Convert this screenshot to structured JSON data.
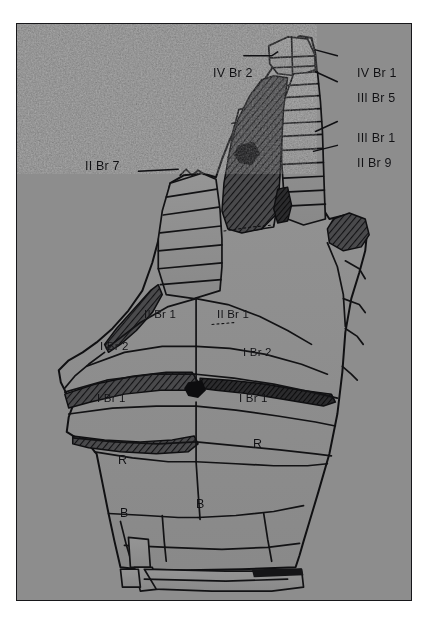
{
  "figure": {
    "kind": "crinoid-calyx-plate-diagram",
    "caption_visible": false,
    "frame": {
      "border_color": "#17171a",
      "field_color": "#8d8d8d",
      "page_color": "#ffffff"
    },
    "ink_color": "#101013"
  },
  "labels": {
    "leader_labels": [
      {
        "id": "iv-br-2",
        "text": "IV Br 2",
        "x": 196,
        "y": 49,
        "anchor": "right",
        "leader": true
      },
      {
        "id": "iv-br-1",
        "text": "IV Br 1",
        "x": 340,
        "y": 49,
        "anchor": "left",
        "leader": true
      },
      {
        "id": "iii-br-5",
        "text": "III Br 5",
        "x": 340,
        "y": 74,
        "anchor": "left",
        "leader": true
      },
      {
        "id": "iii-br-1",
        "text": "III Br 1",
        "x": 340,
        "y": 114,
        "anchor": "left",
        "leader": true
      },
      {
        "id": "ii-br-9",
        "text": "II Br 9",
        "x": 340,
        "y": 139,
        "anchor": "left",
        "leader": true
      },
      {
        "id": "ii-br-7",
        "text": "II Br 7",
        "x": 85,
        "y": 167,
        "anchor": "right",
        "leader": true
      }
    ],
    "plate_labels": [
      {
        "id": "ii-br-1-left",
        "text": "II Br 1",
        "x": 145,
        "y": 312
      },
      {
        "id": "ii-br-1-right",
        "text": "II Br 1",
        "x": 218,
        "y": 312
      },
      {
        "id": "i-br-2-left",
        "text": "I Br 2",
        "x": 100,
        "y": 344
      },
      {
        "id": "i-br-2-right",
        "text": "I Br 2",
        "x": 244,
        "y": 348
      },
      {
        "id": "i-br-1-left",
        "text": "I Br 1",
        "x": 97,
        "y": 396
      },
      {
        "id": "i-br-1-right",
        "text": "I Br 1",
        "x": 240,
        "y": 396
      },
      {
        "id": "radial-left",
        "text": "R",
        "x": 118,
        "y": 459
      },
      {
        "id": "radial-right",
        "text": "R",
        "x": 253,
        "y": 443
      },
      {
        "id": "basal-left",
        "text": "B",
        "x": 120,
        "y": 512
      },
      {
        "id": "basal-right",
        "text": "B",
        "x": 196,
        "y": 503
      }
    ]
  },
  "legend_terms": {
    "Br": "brachial plate",
    "R": "radial plate",
    "B": "basal plate",
    "I": "primibrach series",
    "II": "secundibrach series",
    "III": "tertibrach series",
    "IV": "quartibrach series"
  }
}
